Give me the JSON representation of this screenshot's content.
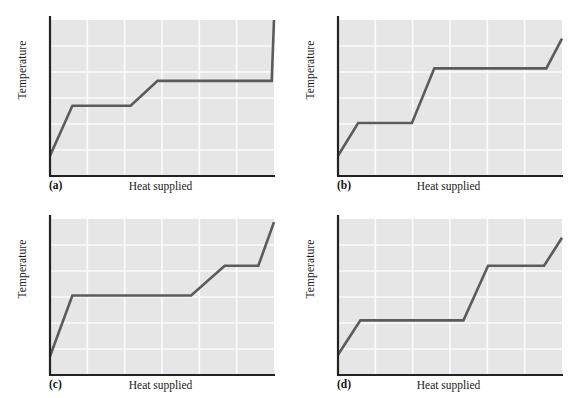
{
  "figure": {
    "background_color": "#ffffff",
    "plot_background_color": "#e6e6e6",
    "gridline_color": "#fbfbfb",
    "axis_color": "#222222",
    "curve_color": "#5b5b5b",
    "panel_count": 4
  },
  "chart_data": [
    {
      "type": "line",
      "title": "",
      "panel_label": "(a)",
      "xlabel": "Heat supplied",
      "ylabel": "Temperature",
      "xlim": [
        0,
        100
      ],
      "ylim": [
        0,
        100
      ],
      "grid": true,
      "xticks": [],
      "yticks": [],
      "legend": "none",
      "series": [
        {
          "name": "heating curve",
          "x": [
            0,
            10,
            36,
            48,
            99,
            100
          ],
          "y": [
            13,
            45,
            45,
            61,
            61,
            100
          ]
        }
      ],
      "annotation": "Two plateaus: first short rise, mid-length first plateau, gentle second rise, very long second plateau, steep final rise."
    },
    {
      "type": "line",
      "title": "",
      "panel_label": "(b)",
      "xlabel": "Heat supplied",
      "ylabel": "Temperature",
      "xlim": [
        0,
        100
      ],
      "ylim": [
        0,
        100
      ],
      "grid": true,
      "xticks": [],
      "yticks": [],
      "legend": "none",
      "series": [
        {
          "name": "heating curve",
          "x": [
            0,
            9,
            33,
            43,
            93,
            100
          ],
          "y": [
            13,
            34,
            34,
            69,
            69,
            88
          ]
        }
      ],
      "annotation": "Low first plateau, steep second rise, long high plateau, short final rise."
    },
    {
      "type": "line",
      "title": "",
      "panel_label": "(c)",
      "xlabel": "Heat supplied",
      "ylabel": "Temperature",
      "xlim": [
        0,
        100
      ],
      "ylim": [
        0,
        100
      ],
      "grid": true,
      "xticks": [],
      "yticks": [],
      "legend": "none",
      "series": [
        {
          "name": "heating curve",
          "x": [
            0,
            10,
            63,
            78,
            93,
            100
          ],
          "y": [
            12,
            51,
            51,
            70,
            70,
            98
          ]
        }
      ],
      "annotation": "Very long first plateau, moderate second rise, short high plateau, steep final rise."
    },
    {
      "type": "line",
      "title": "",
      "panel_label": "(d)",
      "xlabel": "Heat supplied",
      "ylabel": "Temperature",
      "xlim": [
        0,
        100
      ],
      "ylim": [
        0,
        100
      ],
      "grid": true,
      "xticks": [],
      "yticks": [],
      "legend": "none",
      "series": [
        {
          "name": "heating curve",
          "x": [
            0,
            10,
            56,
            67,
            92,
            100
          ],
          "y": [
            13,
            35,
            35,
            70,
            70,
            88
          ]
        }
      ],
      "annotation": "Long low plateau, very steep second rise, high plateau, short final rise."
    }
  ],
  "panels": [
    {
      "letter": "(a)",
      "xlabel": "Heat supplied",
      "ylabel": "Temperature"
    },
    {
      "letter": "(b)",
      "xlabel": "Heat supplied",
      "ylabel": "Temperature"
    },
    {
      "letter": "(c)",
      "xlabel": "Heat supplied",
      "ylabel": "Temperature"
    },
    {
      "letter": "(d)",
      "xlabel": "Heat supplied",
      "ylabel": "Temperature"
    }
  ]
}
